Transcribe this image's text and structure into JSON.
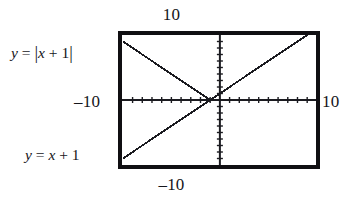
{
  "figure": {
    "name": "graphing-calculator-screen",
    "window_labels": {
      "top": "10",
      "bottom": "–10",
      "left": "–10",
      "right": "10"
    },
    "annotations": {
      "absolute_value": {
        "lhs": "y",
        "equals": "=",
        "open_bar": "|",
        "expr_var": "x",
        "expr_op": "+",
        "expr_num": "1",
        "close_bar": "|"
      },
      "linear": {
        "lhs": "y",
        "equals": "=",
        "expr_var": "x",
        "expr_op": "+",
        "expr_num": "1"
      }
    },
    "colors": {
      "frame": "#100f12",
      "curve": "#1b1b20",
      "axis": "#1b1b20",
      "background": "#ffffff"
    }
  },
  "chart_data": {
    "type": "line",
    "title": "",
    "xlabel": "",
    "ylabel": "",
    "xlim": [
      -10,
      10
    ],
    "ylim": [
      -10,
      10
    ],
    "grid": false,
    "legend": "annotations-on-plot",
    "axis_ticks": {
      "x_tick_step": 1,
      "y_tick_step": 1,
      "x_tick_count": 20,
      "y_tick_count": 20
    },
    "series": [
      {
        "name": "y = |x + 1|",
        "equation": "y = |x + 1|",
        "x": [
          -10,
          -9,
          -8,
          -7,
          -6,
          -5,
          -4,
          -3,
          -2,
          -1,
          0,
          1,
          2,
          3,
          4,
          5,
          6,
          7,
          8,
          9,
          10
        ],
        "values": [
          9,
          8,
          7,
          6,
          5,
          4,
          3,
          2,
          1,
          0,
          1,
          2,
          3,
          4,
          5,
          6,
          7,
          8,
          9,
          10,
          11
        ],
        "vertex": [
          -1,
          0
        ]
      },
      {
        "name": "y = x + 1",
        "equation": "y = x + 1",
        "x": [
          -10,
          -9,
          -8,
          -7,
          -6,
          -5,
          -4,
          -3,
          -2,
          -1,
          0,
          1,
          2,
          3,
          4,
          5,
          6,
          7,
          8,
          9,
          10
        ],
        "values": [
          -9,
          -8,
          -7,
          -6,
          -5,
          -4,
          -3,
          -2,
          -1,
          0,
          1,
          2,
          3,
          4,
          5,
          6,
          7,
          8,
          9,
          10,
          11
        ],
        "x_intercept": [
          -1,
          0
        ],
        "y_intercept": [
          0,
          1
        ]
      }
    ]
  }
}
